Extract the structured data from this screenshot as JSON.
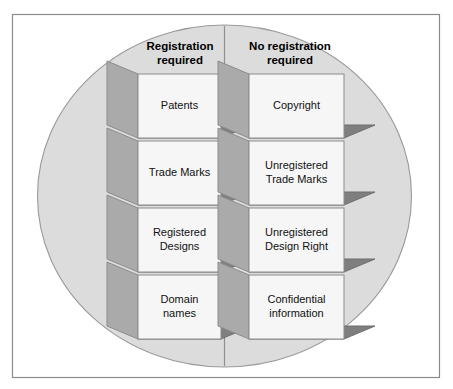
{
  "diagram": {
    "shape": "circle-split-into-two-columns",
    "colors": {
      "page_background": "#ffffff",
      "frame_border": "#8a8a8a",
      "circle_fill": "#dcdcdc",
      "circle_border": "#9a9a9a",
      "divider": "#8f8f8f",
      "box_front": "#f6f6f6",
      "box_left_face": "#aaaaaa",
      "box_bottom_face": "#7f7f7f",
      "box_outline": "#8c8c8c",
      "text": "#000000"
    },
    "columns": [
      {
        "id": "registration-required",
        "header_line1": "Registration",
        "header_line2": "required",
        "items": [
          {
            "id": "patents",
            "line1": "Patents",
            "line2": ""
          },
          {
            "id": "trade-marks",
            "line1": "Trade Marks",
            "line2": ""
          },
          {
            "id": "registered-designs",
            "line1": "Registered",
            "line2": "Designs"
          },
          {
            "id": "domain-names",
            "line1": "Domain",
            "line2": "names"
          }
        ]
      },
      {
        "id": "no-registration-required",
        "header_line1": "No registration",
        "header_line2": "required",
        "items": [
          {
            "id": "copyright",
            "line1": "Copyright",
            "line2": ""
          },
          {
            "id": "unregistered-trade-marks",
            "line1": "Unregistered",
            "line2": "Trade Marks"
          },
          {
            "id": "unregistered-design-right",
            "line1": "Unregistered",
            "line2": "Design Right"
          },
          {
            "id": "confidential-information",
            "line1": "Confidential",
            "line2": "information"
          }
        ]
      }
    ]
  }
}
